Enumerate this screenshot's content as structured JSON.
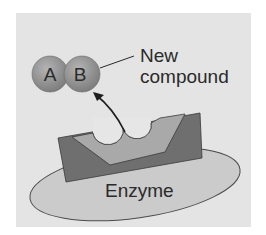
{
  "diagram": {
    "labels": {
      "molecule_a": "A",
      "molecule_b": "B",
      "new_compound_line1": "New",
      "new_compound_line2": "compound",
      "enzyme": "Enzyme"
    },
    "colors": {
      "background_panel": "#e4e4e4",
      "molecule_fill": "#9a9a9a",
      "enzyme_ellipse": "#c9c9c9",
      "active_site_dark": "#6e6e6e",
      "active_site_light": "#a8a8a8",
      "pocket_fill": "#e8e8e8",
      "outline": "#3a3a3a",
      "text": "#2a2a2a"
    }
  }
}
